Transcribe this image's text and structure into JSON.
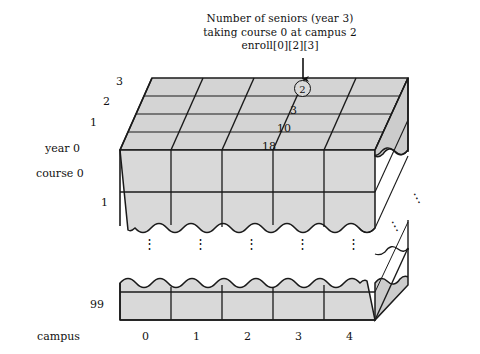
{
  "figure": {
    "title_annotation": {
      "line1": "Number of seniors (year 3)",
      "line2": "taking course 0 at campus 2",
      "line3": "enroll[0][2][3]"
    },
    "highlighted_cell_value": "2",
    "colors": {
      "face_fill": "#d9d9d9",
      "top_fill": "#d4d4d4",
      "side_fill": "#cccccc",
      "outline": "#1a1a1a",
      "text": "#111111",
      "background": "#ffffff"
    }
  },
  "axes": {
    "depth_axis": {
      "label": "year",
      "ticks": [
        "0",
        "1",
        "2",
        "3"
      ]
    },
    "vertical_axis": {
      "label": "course",
      "ticks": [
        "0",
        "1",
        "99"
      ],
      "ellipsis": "⋮"
    },
    "horizontal_axis": {
      "label": "campus",
      "ticks": [
        "0",
        "1",
        "2",
        "3",
        "4"
      ]
    }
  },
  "cell_values": {
    "year3": "2",
    "year2": "3",
    "year1": "10",
    "year0": "18"
  },
  "labels": {
    "year_3": "3",
    "year_2": "2",
    "year_1": "1",
    "year_0": "year 0",
    "course_0": "course 0",
    "course_1": "1",
    "course_99": "99",
    "campus_axis": "campus",
    "campus_0": "0",
    "campus_1": "1",
    "campus_2": "2",
    "campus_3": "3",
    "campus_4": "4"
  }
}
